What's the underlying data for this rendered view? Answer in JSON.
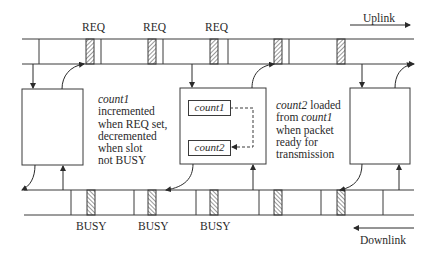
{
  "diagram": {
    "uplink": {
      "label": "Uplink",
      "slot_label": "REQ",
      "req_labels": [
        "REQ",
        "REQ",
        "REQ"
      ]
    },
    "downlink": {
      "label": "Downlink",
      "slot_label": "BUSY",
      "busy_labels": [
        "BUSY",
        "BUSY",
        "BUSY"
      ]
    },
    "node_left": {
      "note_var": "count1",
      "note_lines": [
        "incremented",
        "when REQ set,",
        "decremented",
        "when slot",
        "not BUSY"
      ]
    },
    "node_middle": {
      "register_1": "count1",
      "register_2": "count2",
      "note_var": "count2",
      "note_line1_suffix": " loaded",
      "note_line2_prefix": "from ",
      "note_line2_var": "count1",
      "note_lines_rest": [
        "when packet",
        "ready for",
        "transmission"
      ]
    },
    "colors": {
      "line": "#3a3a3a",
      "background": "#ffffff",
      "hatch": "#555555"
    }
  }
}
